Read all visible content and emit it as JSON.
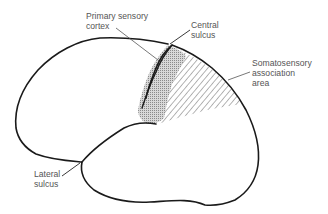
{
  "diagram": {
    "type": "brain-lateral-view",
    "labels": {
      "primary_sensory_cortex": [
        "Primary sensory",
        "cortex"
      ],
      "central_sulcus": [
        "Central",
        "sulcus"
      ],
      "somatosensory_association_area": [
        "Somatosensory",
        "association",
        "area"
      ],
      "lateral_sulcus": [
        "Lateral",
        "sulcus"
      ]
    },
    "colors": {
      "outline": "#1a1a1a",
      "stipple": "#9a9a9a",
      "hatch": "#777777",
      "label_text": "#555555"
    }
  }
}
